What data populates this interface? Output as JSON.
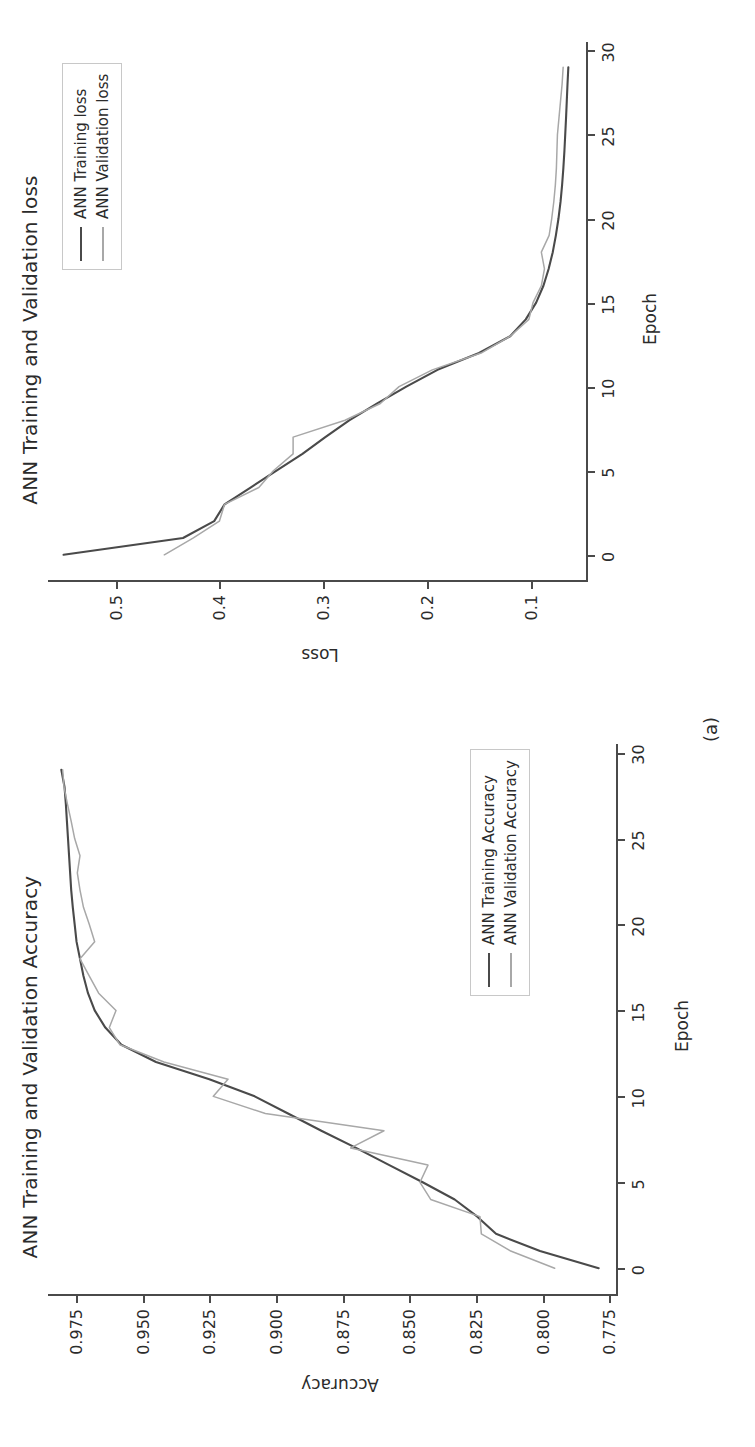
{
  "figure": {
    "subfigure_caption": "(a)",
    "orientation": "rotated-90-ccw",
    "background": "#ffffff",
    "train_color": "#4a4a4a",
    "val_color": "#a8a8a8"
  },
  "charts": [
    {
      "id": "accuracy",
      "title": "ANN Training and Validation Accuracy",
      "xlabel": "Epoch",
      "ylabel": "Accuracy",
      "xticks": [
        "0",
        "5",
        "10",
        "15",
        "20",
        "25",
        "30"
      ],
      "yticks": [
        "0.975",
        "0.950",
        "0.925",
        "0.900",
        "0.875",
        "0.850",
        "0.825",
        "0.800",
        "0.775"
      ],
      "legend": [
        {
          "label": "ANN Training Accuracy",
          "color": "#4a4a4a"
        },
        {
          "label": "ANN Validation Accuracy",
          "color": "#a8a8a8"
        }
      ]
    },
    {
      "id": "loss",
      "title": "ANN Training and Validation loss",
      "xlabel": "Epoch",
      "ylabel": "Loss",
      "xticks": [
        "0",
        "5",
        "10",
        "15",
        "20",
        "25",
        "30"
      ],
      "yticks": [
        "0.5",
        "0.4",
        "0.3",
        "0.2",
        "0.1"
      ],
      "legend": [
        {
          "label": "ANN Training loss",
          "color": "#4a4a4a"
        },
        {
          "label": "ANN Validation loss",
          "color": "#a8a8a8"
        }
      ]
    }
  ],
  "chart_data": [
    {
      "type": "line",
      "id": "accuracy",
      "title": "ANN Training and Validation Accuracy",
      "xlabel": "Epoch",
      "ylabel": "Accuracy",
      "xlim": [
        -1.5,
        30.5
      ],
      "ylim": [
        0.7725,
        0.9855
      ],
      "grid": false,
      "legend_position": "lower right",
      "x": [
        0,
        1,
        2,
        3,
        4,
        5,
        6,
        7,
        8,
        9,
        10,
        11,
        12,
        13,
        14,
        15,
        16,
        17,
        18,
        19,
        20,
        21,
        22,
        23,
        24,
        25,
        26,
        27,
        28,
        29
      ],
      "series": [
        {
          "name": "ANN Training Accuracy",
          "color": "#4a4a4a",
          "values": [
            0.779,
            0.801,
            0.8175,
            0.8245,
            0.833,
            0.845,
            0.8575,
            0.87,
            0.883,
            0.8955,
            0.908,
            0.925,
            0.945,
            0.958,
            0.964,
            0.968,
            0.9705,
            0.9722,
            0.9735,
            0.9748,
            0.9755,
            0.9762,
            0.9768,
            0.9772,
            0.9776,
            0.978,
            0.9784,
            0.9788,
            0.9793,
            0.9805
          ]
        },
        {
          "name": "ANN Validation Accuracy",
          "color": "#a8a8a8",
          "values": [
            0.7955,
            0.812,
            0.823,
            0.8235,
            0.842,
            0.846,
            0.843,
            0.872,
            0.8595,
            0.904,
            0.9235,
            0.918,
            0.942,
            0.9585,
            0.9625,
            0.96,
            0.9665,
            0.97,
            0.9735,
            0.968,
            0.97,
            0.9722,
            0.9735,
            0.9745,
            0.9735,
            0.9755,
            0.9768,
            0.9782,
            0.9795,
            0.98
          ]
        }
      ]
    },
    {
      "type": "line",
      "id": "loss",
      "title": "ANN Training and Validation loss",
      "xlabel": "Epoch",
      "ylabel": "Loss",
      "xlim": [
        -1.5,
        30.5
      ],
      "ylim": [
        0.047,
        0.565
      ],
      "grid": false,
      "legend_position": "upper right",
      "x": [
        0,
        1,
        2,
        3,
        4,
        5,
        6,
        7,
        8,
        9,
        10,
        11,
        12,
        13,
        14,
        15,
        16,
        17,
        18,
        19,
        20,
        21,
        22,
        23,
        24,
        25,
        26,
        27,
        28,
        29
      ],
      "series": [
        {
          "name": "ANN Training loss",
          "color": "#4a4a4a",
          "values": [
            0.55,
            0.435,
            0.405,
            0.395,
            0.37,
            0.345,
            0.32,
            0.298,
            0.275,
            0.248,
            0.22,
            0.19,
            0.15,
            0.12,
            0.105,
            0.095,
            0.088,
            0.083,
            0.079,
            0.076,
            0.0735,
            0.0715,
            0.07,
            0.0688,
            0.0678,
            0.067,
            0.0662,
            0.0655,
            0.0648,
            0.064
          ]
        },
        {
          "name": "ANN Validation loss",
          "color": "#a8a8a8",
          "values": [
            0.453,
            0.425,
            0.4,
            0.395,
            0.362,
            0.348,
            0.329,
            0.329,
            0.279,
            0.245,
            0.227,
            0.195,
            0.148,
            0.12,
            0.102,
            0.098,
            0.09,
            0.087,
            0.09,
            0.0825,
            0.08,
            0.078,
            0.0765,
            0.0755,
            0.075,
            0.0745,
            0.073,
            0.0715,
            0.07,
            0.069
          ]
        }
      ]
    }
  ]
}
